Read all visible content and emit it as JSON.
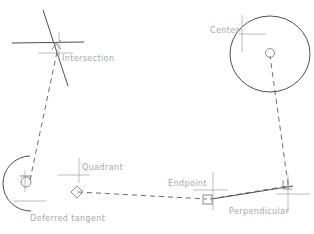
{
  "figure": {
    "type": "cad-object-snap-diagram",
    "background_color": "#ffffff",
    "width": 314,
    "height": 234,
    "geometry_color": "#3b3b3b",
    "dashed_color": "#5a5a5a",
    "crosshair_color": "#b4b4b4",
    "marker_color": "#8c8c8c",
    "label_color": "#a8a8a8",
    "clipped_title": ""
  },
  "labels": {
    "intersection": "Intersection",
    "center": "Center",
    "quadrant": "Quadrant",
    "deferred_tangent": "Deferred  tangent",
    "endpoint": "Endpoint",
    "perpendicular": "Perpendicular"
  },
  "snap_points": [
    {
      "name": "intersection",
      "label": "Intersection",
      "marker": "x-cross",
      "x": 56,
      "y": 44,
      "label_x": 62,
      "label_y": 55
    },
    {
      "name": "center",
      "label": "Center",
      "marker": "circle",
      "x": 270,
      "y": 54,
      "label_x": 210,
      "label_y": 28
    },
    {
      "name": "quadrant",
      "label": "Quadrant",
      "marker": "diamond",
      "x": 76,
      "y": 192,
      "label_x": 82,
      "label_y": 165
    },
    {
      "name": "deferred_tangent",
      "label": "Deferred  tangent",
      "marker": "tangent-circle",
      "x": 30,
      "y": 181,
      "label_x": 31,
      "label_y": 215
    },
    {
      "name": "endpoint",
      "label": "Endpoint",
      "marker": "square",
      "x": 207,
      "y": 199,
      "label_x": 168,
      "label_y": 181
    },
    {
      "name": "perpendicular",
      "label": "Perpendicular",
      "marker": "perpendicular",
      "x": 288,
      "y": 186,
      "label_x": 229,
      "label_y": 209
    }
  ]
}
